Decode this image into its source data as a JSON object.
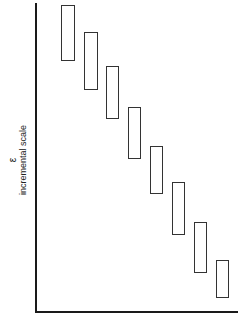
{
  "chart_data": {
    "type": "diagram",
    "title": "",
    "ylabel_symbol": "ε",
    "ylabel": "incremental scale",
    "xlabel": "",
    "axes": {
      "x_axis": true,
      "y_axis": true,
      "ticks": false
    },
    "boxes": [
      {
        "index": 1,
        "x": 61,
        "y": 5,
        "w": 14,
        "h": 56
      },
      {
        "index": 2,
        "x": 84,
        "y": 32,
        "w": 14,
        "h": 58
      },
      {
        "index": 3,
        "x": 106,
        "y": 66,
        "w": 13,
        "h": 53
      },
      {
        "index": 4,
        "x": 128,
        "y": 107,
        "w": 13,
        "h": 52
      },
      {
        "index": 5,
        "x": 150,
        "y": 146,
        "w": 13,
        "h": 48
      },
      {
        "index": 6,
        "x": 172,
        "y": 182,
        "w": 13,
        "h": 53
      },
      {
        "index": 7,
        "x": 194,
        "y": 222,
        "w": 13,
        "h": 51
      },
      {
        "index": 8,
        "x": 216,
        "y": 260,
        "w": 13,
        "h": 38
      }
    ]
  },
  "labels": {
    "symbol": "ε",
    "axis_title": "incremental scale"
  }
}
